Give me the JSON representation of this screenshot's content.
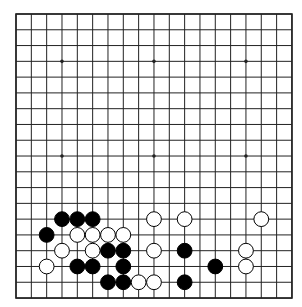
{
  "board": {
    "size": 19,
    "origin_x": 16,
    "origin_y": 14,
    "step_x": 15.33,
    "step_y": 15.78,
    "stone_radius": 7.4,
    "colors": {
      "black": "#000000",
      "white": "#ffffff",
      "line": "#222222"
    },
    "star_points": [
      [
        3,
        3
      ],
      [
        9,
        3
      ],
      [
        15,
        3
      ],
      [
        3,
        9
      ],
      [
        9,
        9
      ],
      [
        15,
        9
      ],
      [
        3,
        15
      ],
      [
        9,
        15
      ],
      [
        15,
        15
      ]
    ],
    "stones": [
      {
        "color": "black",
        "col": 3,
        "row": 13
      },
      {
        "color": "black",
        "col": 4,
        "row": 13
      },
      {
        "color": "black",
        "col": 5,
        "row": 13
      },
      {
        "color": "white",
        "col": 9,
        "row": 13
      },
      {
        "color": "white",
        "col": 11,
        "row": 13
      },
      {
        "color": "white",
        "col": 16,
        "row": 13
      },
      {
        "color": "black",
        "col": 2,
        "row": 14
      },
      {
        "color": "white",
        "col": 4,
        "row": 14
      },
      {
        "color": "white",
        "col": 5,
        "row": 14
      },
      {
        "color": "white",
        "col": 6,
        "row": 14
      },
      {
        "color": "white",
        "col": 7,
        "row": 14
      },
      {
        "color": "white",
        "col": 3,
        "row": 15
      },
      {
        "color": "white",
        "col": 5,
        "row": 15
      },
      {
        "color": "black",
        "col": 6,
        "row": 15
      },
      {
        "color": "black",
        "col": 7,
        "row": 15
      },
      {
        "color": "white",
        "col": 9,
        "row": 15
      },
      {
        "color": "black",
        "col": 11,
        "row": 15
      },
      {
        "color": "white",
        "col": 15,
        "row": 15
      },
      {
        "color": "white",
        "col": 2,
        "row": 16
      },
      {
        "color": "black",
        "col": 4,
        "row": 16
      },
      {
        "color": "black",
        "col": 5,
        "row": 16
      },
      {
        "color": "black",
        "col": 7,
        "row": 16
      },
      {
        "color": "black",
        "col": 13,
        "row": 16
      },
      {
        "color": "white",
        "col": 15,
        "row": 16
      },
      {
        "color": "black",
        "col": 6,
        "row": 17
      },
      {
        "color": "black",
        "col": 7,
        "row": 17
      },
      {
        "color": "white",
        "col": 8,
        "row": 17
      },
      {
        "color": "white",
        "col": 9,
        "row": 17
      },
      {
        "color": "black",
        "col": 11,
        "row": 17
      }
    ]
  }
}
